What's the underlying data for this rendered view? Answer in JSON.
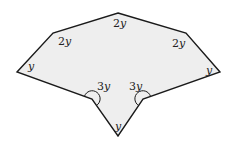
{
  "diagram": {
    "type": "polygon-angles",
    "shape": "concave octagon",
    "fill_color": "#eeeeee",
    "stroke_color": "#1a1a1a",
    "vertices": [
      {
        "name": "top",
        "x": 118,
        "y": 13
      },
      {
        "name": "upper-right",
        "x": 186,
        "y": 33
      },
      {
        "name": "right",
        "x": 220,
        "y": 72
      },
      {
        "name": "right-reflex",
        "x": 143,
        "y": 99
      },
      {
        "name": "bottom",
        "x": 118,
        "y": 136
      },
      {
        "name": "left-reflex",
        "x": 92,
        "y": 99
      },
      {
        "name": "left",
        "x": 17,
        "y": 72
      },
      {
        "name": "upper-left",
        "x": 53,
        "y": 33
      }
    ],
    "angle_labels": [
      {
        "vertex": "top",
        "coef": "2",
        "var": "y"
      },
      {
        "vertex": "upper-left",
        "coef": "2",
        "var": "y"
      },
      {
        "vertex": "upper-right",
        "coef": "2",
        "var": "y"
      },
      {
        "vertex": "left",
        "coef": "",
        "var": "y"
      },
      {
        "vertex": "right",
        "coef": "",
        "var": "y"
      },
      {
        "vertex": "left-reflex",
        "coef": "3",
        "var": "y"
      },
      {
        "vertex": "right-reflex",
        "coef": "3",
        "var": "y"
      },
      {
        "vertex": "bottom",
        "coef": "",
        "var": "y"
      }
    ]
  }
}
